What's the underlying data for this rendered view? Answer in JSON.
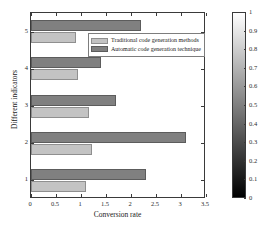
{
  "chart_data": {
    "type": "bar",
    "orientation": "horizontal",
    "title": "",
    "xlabel": "Conversion rate",
    "ylabel": "Different indicators",
    "categories": [
      "1",
      "2",
      "3",
      "4",
      "5"
    ],
    "xlim": [
      0,
      3.5
    ],
    "xticks": [
      "0",
      "0.5",
      "1",
      "1.5",
      "2",
      "2.5",
      "3",
      "3.5"
    ],
    "xtick_values": [
      0,
      0.5,
      1,
      1.5,
      2,
      2.5,
      3,
      3.5
    ],
    "yticks": [
      "1",
      "2",
      "3",
      "4",
      "5"
    ],
    "grid": false,
    "legend_position": "inside-upper-center",
    "series": [
      {
        "name": "Traditional code generation methods",
        "color": "#c3c3c3",
        "values": [
          1.1,
          1.22,
          1.15,
          0.93,
          0.9
        ]
      },
      {
        "name": "Automatic code generation technique",
        "color": "#808080",
        "values": [
          2.3,
          3.1,
          1.7,
          1.4,
          2.2
        ]
      }
    ],
    "colorbar": {
      "min": 0,
      "max": 1,
      "ticks": [
        "0",
        "0.1",
        "0.2",
        "0.3",
        "0.4",
        "0.5",
        "0.6",
        "0.7",
        "0.8",
        "0.9",
        "1"
      ],
      "tick_values": [
        0,
        0.1,
        0.2,
        0.3,
        0.4,
        0.5,
        0.6,
        0.7,
        0.8,
        0.9,
        1
      ],
      "gradient_top_color": "#ffffff",
      "gradient_bottom_color": "#000000"
    }
  },
  "legend": {
    "items": [
      {
        "label": "Traditional code generation methods"
      },
      {
        "label": "Automatic code generation technique"
      }
    ]
  },
  "axes": {
    "x_title": "Conversion rate",
    "y_title": "Different indicators"
  }
}
